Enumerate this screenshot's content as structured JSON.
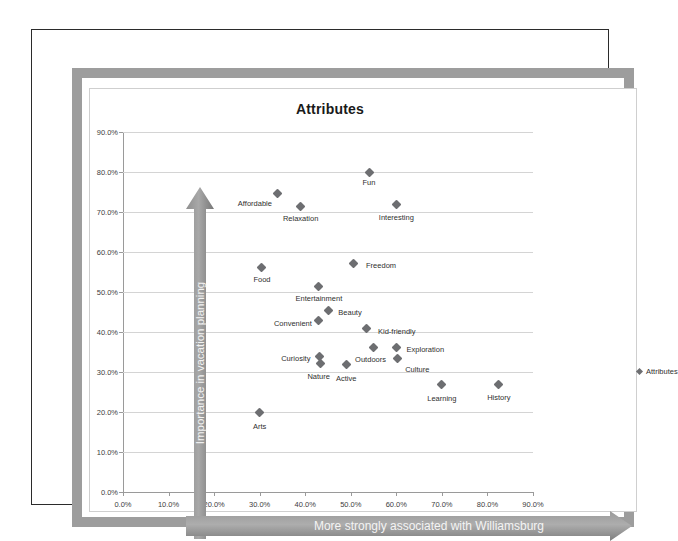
{
  "document": {
    "frame_color": "#9d9d9d",
    "border_color": "#2b2b2b"
  },
  "chart_data": {
    "type": "scatter",
    "title": "Attributes",
    "xlabel": "More strongly associated with Williamsburg",
    "ylabel": "Importance in vacation planning",
    "xlim": [
      0,
      90
    ],
    "ylim": [
      0,
      90
    ],
    "xticks": [
      "0.0%",
      "10.0%",
      "20.0%",
      "30.0%",
      "40.0%",
      "50.0%",
      "60.0%",
      "70.0%",
      "80.0%",
      "90.0%"
    ],
    "yticks": [
      "0.0%",
      "10.0%",
      "20.0%",
      "30.0%",
      "40.0%",
      "50.0%",
      "60.0%",
      "70.0%",
      "80.0%",
      "90.0%"
    ],
    "xtick_values": [
      0,
      10,
      20,
      30,
      40,
      50,
      60,
      70,
      80,
      90
    ],
    "ytick_values": [
      0,
      10,
      20,
      30,
      40,
      50,
      60,
      70,
      80,
      90
    ],
    "grid": "horizontal",
    "legend": [
      "Attributes"
    ],
    "legend_position": "right",
    "marker": "diamond",
    "marker_color": "#6d6e71",
    "points": [
      {
        "label": "Fun",
        "x": 54.0,
        "y": 80.0,
        "label_dx": 0,
        "label_dy": 11
      },
      {
        "label": "Affordable",
        "x": 34.0,
        "y": 74.7,
        "label_dx": -23,
        "label_dy": 11
      },
      {
        "label": "Relaxation",
        "x": 39.0,
        "y": 71.5,
        "label_dx": 0,
        "label_dy": 13
      },
      {
        "label": "Interesting",
        "x": 60.0,
        "y": 71.8,
        "label_dx": 0,
        "label_dy": 13
      },
      {
        "label": "Food",
        "x": 30.5,
        "y": 56.2,
        "label_dx": 0,
        "label_dy": 13
      },
      {
        "label": "Freedom",
        "x": 50.5,
        "y": 57.2,
        "label_dx": 28,
        "label_dy": 3
      },
      {
        "label": "Entertainment",
        "x": 43.0,
        "y": 51.5,
        "label_dx": 0,
        "label_dy": 13
      },
      {
        "label": "Beauty",
        "x": 45.0,
        "y": 45.5,
        "label_dx": 22,
        "label_dy": 3
      },
      {
        "label": "Convenient",
        "x": 43.0,
        "y": 43.0,
        "label_dx": -26,
        "label_dy": 4
      },
      {
        "label": "Kid-friendly",
        "x": 53.5,
        "y": 40.8,
        "label_dx": 30,
        "label_dy": 3
      },
      {
        "label": "Exploration",
        "x": 60.0,
        "y": 36.2,
        "label_dx": 29,
        "label_dy": 3
      },
      {
        "label": "Outdoors",
        "x": 55.0,
        "y": 36.2,
        "label_dx": -3,
        "label_dy": 13
      },
      {
        "label": "Culture",
        "x": 60.2,
        "y": 33.5,
        "label_dx": 20,
        "label_dy": 12
      },
      {
        "label": "Curiosity",
        "x": 43.2,
        "y": 34.0,
        "label_dx": -24,
        "label_dy": 3
      },
      {
        "label": "Nature",
        "x": 43.4,
        "y": 32.2,
        "label_dx": -2,
        "label_dy": 14
      },
      {
        "label": "Active",
        "x": 49.0,
        "y": 31.8,
        "label_dx": 0,
        "label_dy": 14
      },
      {
        "label": "Learning",
        "x": 70.0,
        "y": 26.8,
        "label_dx": 0,
        "label_dy": 14
      },
      {
        "label": "History",
        "x": 82.5,
        "y": 27.0,
        "label_dx": 0,
        "label_dy": 14
      },
      {
        "label": "Arts",
        "x": 30.0,
        "y": 19.8,
        "label_dx": 0,
        "label_dy": 14
      }
    ]
  }
}
